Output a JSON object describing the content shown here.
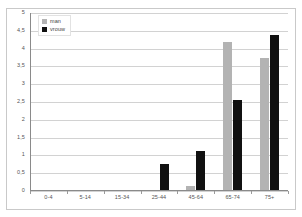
{
  "chart_data": {
    "type": "bar",
    "title": "",
    "subtitle": "",
    "xlabel": "",
    "ylabel": "",
    "categories": [
      "0-4",
      "5-14",
      "15-34",
      "25-44",
      "45-64",
      "65-74",
      "75+"
    ],
    "series": [
      {
        "name": "man",
        "color": "#b3b3b3",
        "values": [
          0,
          0,
          0,
          0,
          0.1,
          4.15,
          3.7
        ]
      },
      {
        "name": "vrouw",
        "color": "#111111",
        "values": [
          0,
          0,
          0,
          0.72,
          1.1,
          2.52,
          4.35
        ]
      }
    ],
    "ylim": [
      0,
      5
    ],
    "ytick_step": 0.5,
    "yticks": [
      "0",
      "0,5",
      "1",
      "1,5",
      "2",
      "2,5",
      "3",
      "3,5",
      "4",
      "4,5",
      "5"
    ],
    "grid": true,
    "grid_color": "#d2d2d2",
    "legend_position": "top-left",
    "axis_color": "#8a8a8a",
    "background": "#ffffff",
    "border_color": "#c9c9c9"
  }
}
